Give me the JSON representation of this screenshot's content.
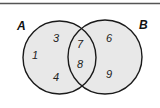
{
  "diagram": {
    "type": "venn",
    "colors": {
      "background": "#ffffff",
      "circle_fill": "#e8e8e8",
      "circle_stroke": "#1a1a1a",
      "top_rule": "#555555"
    },
    "sets": [
      {
        "name": "A",
        "label": "A",
        "only": [
          "3",
          "1",
          "4"
        ]
      },
      {
        "name": "B",
        "label": "B",
        "only": [
          "6",
          "9"
        ]
      }
    ],
    "intersection": [
      "7",
      "8"
    ],
    "regions": {
      "a_only": {
        "n1": "3",
        "n2": "1",
        "n3": "4"
      },
      "a_and_b": {
        "n1": "7",
        "n2": "8"
      },
      "b_only": {
        "n1": "6",
        "n2": "9"
      }
    },
    "labels": {
      "set_a": "A",
      "set_b": "B"
    }
  }
}
